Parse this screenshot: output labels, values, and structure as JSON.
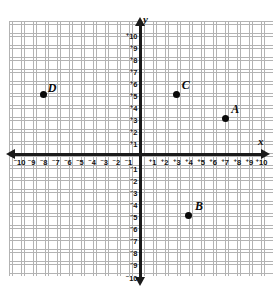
{
  "figure": {
    "type": "coordinate-plane",
    "axes": {
      "x_name": "x",
      "y_name": "y",
      "x_min": -10,
      "x_max": 10,
      "y_min": -10,
      "y_max": 10,
      "step": 1,
      "grid": true
    },
    "x_ticks": [
      {
        "label": "10",
        "sign": "–",
        "value": -10
      },
      {
        "label": "9",
        "sign": "–",
        "value": -9
      },
      {
        "label": "8",
        "sign": "–",
        "value": -8
      },
      {
        "label": "7",
        "sign": "–",
        "value": -7
      },
      {
        "label": "6",
        "sign": "–",
        "value": -6
      },
      {
        "label": "5",
        "sign": "–",
        "value": -5
      },
      {
        "label": "4",
        "sign": "–",
        "value": -4
      },
      {
        "label": "3",
        "sign": "–",
        "value": -3
      },
      {
        "label": "2",
        "sign": "–",
        "value": -2
      },
      {
        "label": "1",
        "sign": "–",
        "value": -1
      },
      {
        "label": "1",
        "sign": "+",
        "value": 1
      },
      {
        "label": "2",
        "sign": "+",
        "value": 2
      },
      {
        "label": "3",
        "sign": "+",
        "value": 3
      },
      {
        "label": "4",
        "sign": "+",
        "value": 4
      },
      {
        "label": "5",
        "sign": "+",
        "value": 5
      },
      {
        "label": "6",
        "sign": "+",
        "value": 6
      },
      {
        "label": "7",
        "sign": "+",
        "value": 7
      },
      {
        "label": "8",
        "sign": "+",
        "value": 8
      },
      {
        "label": "9",
        "sign": "+",
        "value": 9
      },
      {
        "label": "10",
        "sign": "+",
        "value": 10
      }
    ],
    "y_ticks": [
      {
        "label": "10",
        "sign": "+",
        "value": 10
      },
      {
        "label": "9",
        "sign": "+",
        "value": 9
      },
      {
        "label": "8",
        "sign": "+",
        "value": 8
      },
      {
        "label": "7",
        "sign": "+",
        "value": 7
      },
      {
        "label": "6",
        "sign": "+",
        "value": 6
      },
      {
        "label": "5",
        "sign": "+",
        "value": 5
      },
      {
        "label": "4",
        "sign": "+",
        "value": 4
      },
      {
        "label": "3",
        "sign": "+",
        "value": 3
      },
      {
        "label": "2",
        "sign": "+",
        "value": 2
      },
      {
        "label": "1",
        "sign": "+",
        "value": 1
      },
      {
        "label": "1",
        "sign": "–",
        "value": -1
      },
      {
        "label": "2",
        "sign": "–",
        "value": -2
      },
      {
        "label": "3",
        "sign": "–",
        "value": -3
      },
      {
        "label": "4",
        "sign": "–",
        "value": -4
      },
      {
        "label": "5",
        "sign": "–",
        "value": -5
      },
      {
        "label": "6",
        "sign": "–",
        "value": -6
      },
      {
        "label": "7",
        "sign": "–",
        "value": -7
      },
      {
        "label": "8",
        "sign": "–",
        "value": -8
      },
      {
        "label": "9",
        "sign": "–",
        "value": -9
      },
      {
        "label": "10",
        "sign": "–",
        "value": -10
      }
    ],
    "points": [
      {
        "label": "A",
        "x": 7,
        "y": 3,
        "label_dx": 6,
        "label_dy": -16
      },
      {
        "label": "B",
        "x": 4,
        "y": -5,
        "label_dx": 6,
        "label_dy": -16
      },
      {
        "label": "C",
        "x": 3,
        "y": 5,
        "label_dx": 5,
        "label_dy": -16
      },
      {
        "label": "D",
        "x": -8,
        "y": 5,
        "label_dx": 4,
        "label_dy": -13
      }
    ]
  },
  "chart_data": {
    "type": "scatter",
    "title": "",
    "xlabel": "x",
    "ylabel": "y",
    "xlim": [
      -10,
      10
    ],
    "ylim": [
      -10,
      10
    ],
    "grid": true,
    "legend": "none",
    "series": [
      {
        "name": "plotted points",
        "points": [
          {
            "name": "A",
            "x": 7,
            "y": 3
          },
          {
            "name": "B",
            "x": 4,
            "y": -5
          },
          {
            "name": "C",
            "x": 3,
            "y": 5
          },
          {
            "name": "D",
            "x": -8,
            "y": 5
          }
        ]
      }
    ]
  }
}
